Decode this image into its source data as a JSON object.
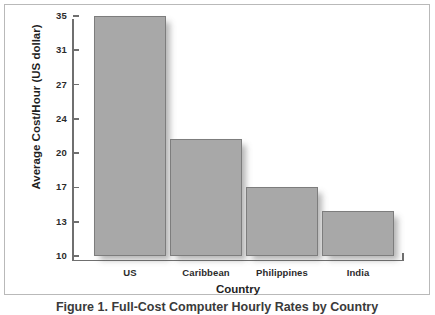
{
  "figure": {
    "caption": "Figure 1. Full-Cost Computer Hourly Rates by Country"
  },
  "chart_data": {
    "type": "bar",
    "title": "",
    "xlabel": "Country",
    "ylabel": "Average Cost/Hour (US dollar)",
    "categories": [
      "US",
      "Caribbean",
      "Philippines",
      "India"
    ],
    "values": [
      35,
      21.7,
      17,
      14.2
    ],
    "ylim": [
      10,
      35
    ],
    "ytick_labels": [
      "35",
      "31",
      "27",
      "24",
      "20",
      "17",
      "13",
      "10"
    ],
    "ytick_values": [
      35,
      31,
      27,
      24,
      20,
      17,
      13,
      10
    ],
    "grid": false,
    "legend": null,
    "bar_color": "#a8a8a8",
    "bar_edge_color": "#7d7d7d",
    "axis_color": "#6f6f6f",
    "frame_color": "#b9b9b9",
    "background_color": "#ffffff"
  }
}
